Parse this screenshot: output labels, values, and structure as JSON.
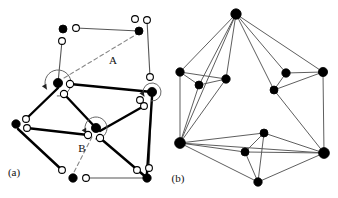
{
  "figure": {
    "title": "",
    "background_color": "#ffffff",
    "width": 338,
    "height": 198,
    "panels": [
      {
        "id": "a",
        "label": "(a)",
        "label_pos": [
          14,
          176
        ],
        "description": "planar graph with vertices split into half-edge slots, rotation arrows and dashed labelled arcs"
      },
      {
        "id": "b",
        "label": "(b)",
        "label_pos": [
          178,
          182
        ],
        "description": "plain planar graph with filled vertices and thin straight edges"
      }
    ]
  },
  "colors": {
    "node_fill": "#000000",
    "node_stroke": "#000000",
    "open_fill": "#ffffff",
    "open_stroke": "#000000",
    "edge_thin": "#555555",
    "edge_thick": "#000000",
    "dashed": "#888888",
    "text": "#111111"
  },
  "panel_a": {
    "labels": [
      {
        "name": "label-A",
        "text": "A",
        "x": 113,
        "y": 64
      },
      {
        "name": "label-B",
        "text": "B",
        "x": 82,
        "y": 152
      },
      {
        "name": "panel-label-a",
        "text": "(a)",
        "x": 14,
        "y": 176
      }
    ],
    "black_nodes": [
      {
        "name": "node-a-top-left",
        "x": 63,
        "y": 29,
        "r": 4.0
      },
      {
        "name": "node-a-top-right",
        "x": 139,
        "y": 31,
        "r": 4.0
      },
      {
        "name": "node-a-center-upper",
        "x": 58,
        "y": 83,
        "r": 4.6
      },
      {
        "name": "node-a-right-mid",
        "x": 152,
        "y": 92,
        "r": 4.6
      },
      {
        "name": "node-a-left",
        "x": 16,
        "y": 124,
        "r": 4.2
      },
      {
        "name": "node-a-center-lower",
        "x": 96,
        "y": 128,
        "r": 4.6
      },
      {
        "name": "node-a-bottom-left",
        "x": 73,
        "y": 178,
        "r": 4.2
      },
      {
        "name": "node-a-bottom-right",
        "x": 147,
        "y": 178,
        "r": 4.2
      }
    ],
    "open_nodes": [
      {
        "name": "open-a-01",
        "x": 76,
        "y": 28,
        "r": 3.4
      },
      {
        "name": "open-a-02",
        "x": 62,
        "y": 41,
        "r": 3.4
      },
      {
        "name": "open-a-03",
        "x": 135,
        "y": 19,
        "r": 3.4
      },
      {
        "name": "open-a-04",
        "x": 147,
        "y": 20,
        "r": 3.4
      },
      {
        "name": "open-a-05",
        "x": 150,
        "y": 77,
        "r": 3.4
      },
      {
        "name": "open-a-06",
        "x": 70,
        "y": 84,
        "r": 3.6
      },
      {
        "name": "open-a-07",
        "x": 64,
        "y": 94,
        "r": 3.6
      },
      {
        "name": "open-a-08",
        "x": 140,
        "y": 100,
        "r": 3.4
      },
      {
        "name": "open-a-09",
        "x": 144,
        "y": 106,
        "r": 3.4
      },
      {
        "name": "open-a-10",
        "x": 26,
        "y": 119,
        "r": 3.4
      },
      {
        "name": "open-a-11",
        "x": 27,
        "y": 128,
        "r": 3.4
      },
      {
        "name": "open-a-12",
        "x": 88,
        "y": 135,
        "r": 3.6
      },
      {
        "name": "open-a-13",
        "x": 100,
        "y": 138,
        "r": 3.6
      },
      {
        "name": "open-a-14",
        "x": 62,
        "y": 170,
        "r": 3.4
      },
      {
        "name": "open-a-15",
        "x": 86,
        "y": 178,
        "r": 3.4
      },
      {
        "name": "open-a-16",
        "x": 137,
        "y": 170,
        "r": 3.4
      },
      {
        "name": "open-a-17",
        "x": 149,
        "y": 168,
        "r": 3.4
      }
    ],
    "thin_edges": [
      {
        "name": "edge-a-top",
        "x1": 76,
        "y1": 28,
        "x2": 139,
        "y2": 31
      },
      {
        "name": "edge-a-topleft-down",
        "x1": 62,
        "y1": 41,
        "x2": 58,
        "y2": 83
      },
      {
        "name": "edge-a-topright-down",
        "x1": 147,
        "y1": 20,
        "x2": 150,
        "y2": 77
      },
      {
        "name": "edge-a-right-vert",
        "x1": 152,
        "y1": 92,
        "x2": 149,
        "y2": 168
      },
      {
        "name": "edge-a-bottom",
        "x1": 86,
        "y1": 178,
        "x2": 147,
        "y2": 178
      }
    ],
    "thick_edges": [
      {
        "name": "edge-a-center-to-right",
        "x1": 70,
        "y1": 84,
        "x2": 152,
        "y2": 92
      },
      {
        "name": "edge-a-center-to-centerlower",
        "x1": 64,
        "y1": 94,
        "x2": 96,
        "y2": 128
      },
      {
        "name": "edge-a-center-to-left",
        "x1": 58,
        "y1": 88,
        "x2": 26,
        "y2": 119
      },
      {
        "name": "edge-a-left-to-centerlower",
        "x1": 27,
        "y1": 128,
        "x2": 88,
        "y2": 135
      },
      {
        "name": "edge-a-centerlower-to-right",
        "x1": 100,
        "y1": 131,
        "x2": 144,
        "y2": 106
      },
      {
        "name": "edge-a-centerlower-to-bottomright",
        "x1": 100,
        "y1": 138,
        "x2": 147,
        "y2": 178
      },
      {
        "name": "edge-a-left-to-bottomleft",
        "x1": 18,
        "y1": 129,
        "x2": 62,
        "y2": 170
      },
      {
        "name": "edge-a-right-to-bottomright",
        "x1": 152,
        "y1": 97,
        "x2": 147,
        "y2": 173
      }
    ],
    "dashed_edges": [
      {
        "name": "dashed-edge-A",
        "x1": 64,
        "y1": 78,
        "x2": 137,
        "y2": 34
      },
      {
        "name": "dashed-edge-B",
        "x1": 92,
        "y1": 137,
        "x2": 73,
        "y2": 174
      }
    ],
    "rotation_arrows": [
      {
        "name": "rotation-arrow-center-upper",
        "cx": 58,
        "cy": 83,
        "r": 13
      },
      {
        "name": "rotation-arrow-center-lower",
        "cx": 96,
        "cy": 128,
        "r": 11
      },
      {
        "name": "rotation-arrow-right-mid",
        "cx": 152,
        "cy": 92,
        "r": 9
      }
    ]
  },
  "panel_b": {
    "labels": [
      {
        "name": "panel-label-b",
        "text": "(b)",
        "x": 178,
        "y": 182
      }
    ],
    "nodes": [
      {
        "name": "node-b-top",
        "id": 0,
        "x": 236,
        "y": 14,
        "r": 5.2
      },
      {
        "name": "node-b-left-outer",
        "id": 1,
        "x": 180,
        "y": 72,
        "r": 4.2
      },
      {
        "name": "node-b-left-inner-a",
        "id": 2,
        "x": 199,
        "y": 85,
        "r": 4.0
      },
      {
        "name": "node-b-left-inner-b",
        "id": 3,
        "x": 226,
        "y": 79,
        "r": 4.2
      },
      {
        "name": "node-b-right-inner-a",
        "id": 4,
        "x": 286,
        "y": 73,
        "r": 4.2
      },
      {
        "name": "node-b-right-inner-b",
        "id": 5,
        "x": 274,
        "y": 90,
        "r": 4.0
      },
      {
        "name": "node-b-right-outer",
        "id": 6,
        "x": 323,
        "y": 72,
        "r": 4.6
      },
      {
        "name": "node-b-bottom-left",
        "id": 7,
        "x": 180,
        "y": 143,
        "r": 5.4
      },
      {
        "name": "node-b-bottom-inner-a",
        "id": 8,
        "x": 264,
        "y": 133,
        "r": 4.0
      },
      {
        "name": "node-b-bottom-inner-b",
        "id": 9,
        "x": 245,
        "y": 152,
        "r": 4.0
      },
      {
        "name": "node-b-bottom-mid",
        "id": 10,
        "x": 258,
        "y": 182,
        "r": 4.2
      },
      {
        "name": "node-b-bottom-right",
        "id": 11,
        "x": 324,
        "y": 153,
        "r": 5.4
      }
    ],
    "edges": [
      {
        "name": "edge-b-0-1",
        "from": 0,
        "to": 1
      },
      {
        "name": "edge-b-0-2",
        "from": 0,
        "to": 2
      },
      {
        "name": "edge-b-0-3",
        "from": 0,
        "to": 3
      },
      {
        "name": "edge-b-0-7",
        "from": 0,
        "to": 7
      },
      {
        "name": "edge-b-0-4",
        "from": 0,
        "to": 4
      },
      {
        "name": "edge-b-0-5",
        "from": 0,
        "to": 5
      },
      {
        "name": "edge-b-0-6",
        "from": 0,
        "to": 6
      },
      {
        "name": "edge-b-1-2",
        "from": 1,
        "to": 2
      },
      {
        "name": "edge-b-1-3",
        "from": 1,
        "to": 3
      },
      {
        "name": "edge-b-1-7",
        "from": 1,
        "to": 7
      },
      {
        "name": "edge-b-2-3",
        "from": 2,
        "to": 3
      },
      {
        "name": "edge-b-2-7",
        "from": 2,
        "to": 7
      },
      {
        "name": "edge-b-3-7",
        "from": 3,
        "to": 7
      },
      {
        "name": "edge-b-4-5",
        "from": 4,
        "to": 5
      },
      {
        "name": "edge-b-4-6",
        "from": 4,
        "to": 6
      },
      {
        "name": "edge-b-5-6",
        "from": 5,
        "to": 6
      },
      {
        "name": "edge-b-5-11",
        "from": 5,
        "to": 11
      },
      {
        "name": "edge-b-6-11",
        "from": 6,
        "to": 11
      },
      {
        "name": "edge-b-7-8",
        "from": 7,
        "to": 8
      },
      {
        "name": "edge-b-7-9",
        "from": 7,
        "to": 9
      },
      {
        "name": "edge-b-7-10",
        "from": 7,
        "to": 10
      },
      {
        "name": "edge-b-7-11",
        "from": 7,
        "to": 11
      },
      {
        "name": "edge-b-8-9",
        "from": 8,
        "to": 9
      },
      {
        "name": "edge-b-8-10",
        "from": 8,
        "to": 10
      },
      {
        "name": "edge-b-8-11",
        "from": 8,
        "to": 11
      },
      {
        "name": "edge-b-9-10",
        "from": 9,
        "to": 10
      },
      {
        "name": "edge-b-9-11",
        "from": 9,
        "to": 11
      },
      {
        "name": "edge-b-10-11",
        "from": 10,
        "to": 11
      }
    ]
  }
}
